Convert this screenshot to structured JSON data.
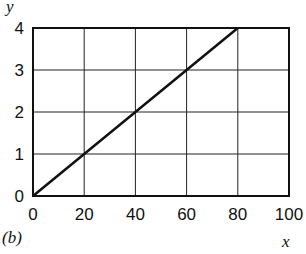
{
  "chart_data": {
    "type": "line",
    "title": "",
    "panel_label": "(b)",
    "xlabel": "x",
    "ylabel": "y",
    "xlim": [
      0,
      100
    ],
    "ylim": [
      0,
      4
    ],
    "x_ticks": [
      "0",
      "20",
      "40",
      "60",
      "80",
      "100"
    ],
    "y_ticks": [
      "0",
      "1",
      "2",
      "3",
      "4"
    ],
    "grid": true,
    "series": [
      {
        "name": "y = x/20",
        "x": [
          0,
          20,
          40,
          60,
          80
        ],
        "y": [
          0,
          1,
          2,
          3,
          4
        ]
      }
    ]
  },
  "colors": {
    "line": "#111111",
    "grid": "#222222",
    "background": "#ffffff"
  }
}
